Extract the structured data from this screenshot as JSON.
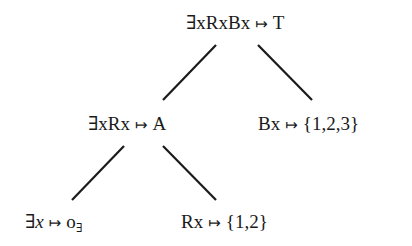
{
  "diagram": {
    "type": "tree",
    "arrow_symbol": "↦",
    "line_color": "#1a1a1a",
    "nodes": {
      "root": {
        "formula": "∃xRxBx",
        "value": "T"
      },
      "left": {
        "formula": "∃xRx",
        "value": "A"
      },
      "right": {
        "formula": "Bx",
        "value": "{1,2,3}"
      },
      "left_left": {
        "formula_prefix": "∃",
        "formula_var": "x",
        "value_main": "o",
        "value_sub": "∃"
      },
      "left_right": {
        "formula": "Rx",
        "value": "{1,2}"
      }
    },
    "edges": [
      {
        "from": "root",
        "to": "left"
      },
      {
        "from": "root",
        "to": "right"
      },
      {
        "from": "left",
        "to": "left_left"
      },
      {
        "from": "left",
        "to": "left_right"
      }
    ]
  }
}
